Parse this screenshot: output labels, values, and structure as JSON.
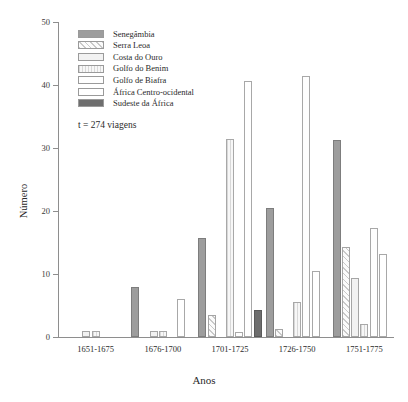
{
  "chart_data": {
    "type": "bar",
    "title": "",
    "xlabel": "Anos",
    "ylabel": "Número",
    "ylim": [
      0,
      50
    ],
    "yticks": [
      0,
      10,
      20,
      30,
      40,
      50
    ],
    "grid": false,
    "legend_position": "top-left",
    "annotation": "t = 274 viagens",
    "categories": [
      "1651-1675",
      "1676-1700",
      "1701-1725",
      "1726-1750",
      "1751-1775"
    ],
    "series": [
      {
        "name": "Senegâmbia",
        "swatch": "s-senegambia",
        "values": [
          0,
          8,
          15.7,
          20.5,
          31.3
        ]
      },
      {
        "name": "Serra Leoa",
        "swatch": "s-serraleoa",
        "values": [
          0,
          0,
          3.5,
          1.3,
          14.3
        ]
      },
      {
        "name": "Costa do Ouro",
        "swatch": "s-costaouro",
        "values": [
          1,
          1,
          0,
          0,
          9.3
        ]
      },
      {
        "name": "Golfo do Benim",
        "swatch": "s-golfobenim",
        "values": [
          1,
          1,
          31.5,
          5.5,
          2
        ]
      },
      {
        "name": "Golfo de Biafra",
        "swatch": "s-golfobiafra",
        "values": [
          0,
          0,
          0.8,
          41.5,
          17.3
        ]
      },
      {
        "name": "África Centro-ocidental",
        "swatch": "s-africaco",
        "values": [
          0,
          6,
          40.7,
          10.5,
          13.2
        ]
      },
      {
        "name": "Sudeste da África",
        "swatch": "s-sudeste",
        "values": [
          0,
          0,
          4.3,
          0,
          0
        ]
      }
    ]
  }
}
